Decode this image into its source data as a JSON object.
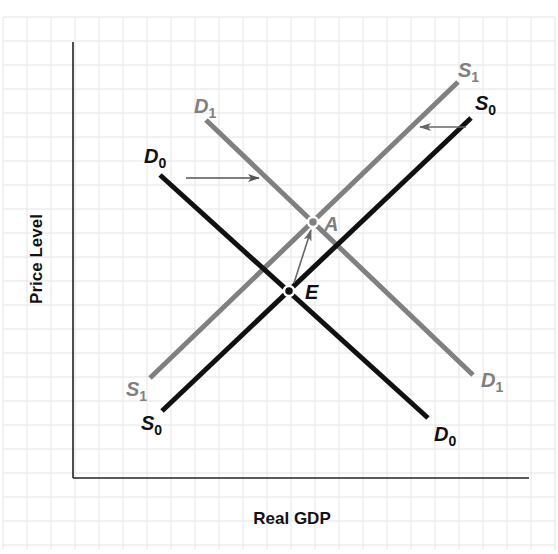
{
  "diagram": {
    "type": "aggregate-demand-aggregate-supply",
    "x_axis_label": "Real GDP",
    "y_axis_label": "Price Level",
    "colors": {
      "original": "#111111",
      "shifted": "#808080",
      "grid": "#e4e4e4",
      "axis": "#222222"
    },
    "curves": [
      {
        "id": "D0",
        "base": "D",
        "sub": "0",
        "kind": "demand",
        "style": "original"
      },
      {
        "id": "D1",
        "base": "D",
        "sub": "1",
        "kind": "demand",
        "style": "shifted"
      },
      {
        "id": "S0",
        "base": "S",
        "sub": "0",
        "kind": "supply",
        "style": "original"
      },
      {
        "id": "S1",
        "base": "S",
        "sub": "1",
        "kind": "supply",
        "style": "shifted"
      }
    ],
    "points": [
      {
        "id": "E",
        "label": "E",
        "description": "original equilibrium (D0 ∩ S0)"
      },
      {
        "id": "A",
        "label": "A",
        "description": "new equilibrium (D1 ∩ S1)"
      }
    ],
    "arrows": [
      {
        "id": "demand-shift",
        "description": "demand shifts right from D0 to D1"
      },
      {
        "id": "supply-shift",
        "description": "supply shifts left from S0 to S1"
      },
      {
        "id": "equilibrium-move",
        "description": "equilibrium moves from E to A"
      }
    ]
  }
}
